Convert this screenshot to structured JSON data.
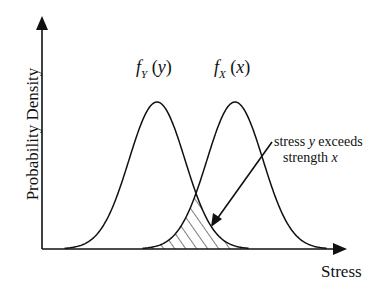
{
  "figure": {
    "type": "stress-strength interference diagram",
    "y_axis_label": "Probability Density",
    "x_axis_label": "Stress",
    "curves": [
      {
        "name": "f_Y(y)",
        "func": "f",
        "subscript": "Y",
        "var": "y",
        "description": "stress distribution",
        "peak_x": 157,
        "sigma_px": 28
      },
      {
        "name": "f_X(x)",
        "func": "f",
        "subscript": "X",
        "var": "x",
        "description": "strength distribution",
        "peak_x": 235,
        "sigma_px": 28
      }
    ],
    "annotation": {
      "line1_prefix": "stress ",
      "line1_var": "y",
      "line1_suffix": " exceeds",
      "line2_prefix": "strength ",
      "line2_var": "x",
      "target": "hatched overlap region"
    },
    "colors": {
      "stroke": "#111111",
      "background": "#ffffff"
    }
  }
}
